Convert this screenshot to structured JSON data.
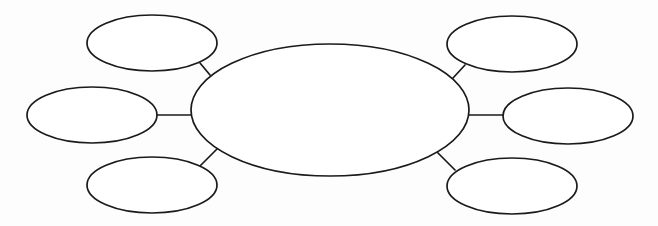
{
  "diagram": {
    "type": "bubble-map",
    "stroke_color": "#1a1a1a",
    "background_color": "#ffffff",
    "center": {
      "label": "",
      "cx": 330,
      "cy": 110,
      "rx": 139,
      "ry": 66
    },
    "branches": [
      {
        "id": "top-left",
        "label": "",
        "cx": 152,
        "cy": 43,
        "rx": 65,
        "ry": 28,
        "connector": {
          "x1": 200,
          "y1": 63,
          "x2": 210,
          "y2": 75
        }
      },
      {
        "id": "middle-left",
        "label": "",
        "cx": 92,
        "cy": 115,
        "rx": 65,
        "ry": 28,
        "connector": {
          "x1": 157,
          "y1": 115,
          "x2": 191,
          "y2": 115
        }
      },
      {
        "id": "bottom-left",
        "label": "",
        "cx": 152,
        "cy": 185,
        "rx": 65,
        "ry": 28,
        "connector": {
          "x1": 200,
          "y1": 166,
          "x2": 218,
          "y2": 148
        }
      },
      {
        "id": "top-right",
        "label": "",
        "cx": 512,
        "cy": 44,
        "rx": 65,
        "ry": 28,
        "connector": {
          "x1": 465,
          "y1": 65,
          "x2": 453,
          "y2": 78
        }
      },
      {
        "id": "middle-right",
        "label": "",
        "cx": 568,
        "cy": 116,
        "rx": 65,
        "ry": 28,
        "connector": {
          "x1": 469,
          "y1": 115,
          "x2": 503,
          "y2": 115
        }
      },
      {
        "id": "bottom-right",
        "label": "",
        "cx": 512,
        "cy": 186,
        "rx": 65,
        "ry": 28,
        "connector": {
          "x1": 437,
          "y1": 152,
          "x2": 455,
          "y2": 170
        }
      }
    ]
  }
}
